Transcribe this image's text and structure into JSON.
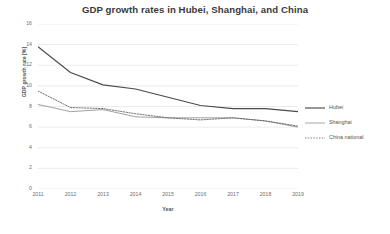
{
  "chart_data": {
    "type": "line",
    "title": "GDP growth rates in Hubei, Shanghai, and China",
    "xlabel": "Year",
    "ylabel": "GDP growth rate [%]",
    "categories": [
      "2011",
      "2012",
      "2013",
      "2014",
      "2015",
      "2016",
      "2017",
      "2018",
      "2019"
    ],
    "x": [
      2011,
      2012,
      2013,
      2014,
      2015,
      2016,
      2017,
      2018,
      2019
    ],
    "ylim": [
      0,
      16
    ],
    "yticks": [
      0,
      2,
      4,
      6,
      8,
      10,
      12,
      14,
      16
    ],
    "grid": true,
    "legend_position": "right",
    "series": [
      {
        "name": "Hubei",
        "style": "solid",
        "color": "#4a4a4a",
        "values": [
          13.8,
          11.3,
          10.1,
          9.7,
          8.9,
          8.1,
          7.8,
          7.8,
          7.5
        ]
      },
      {
        "name": "Shanghai",
        "style": "solid",
        "color": "#909090",
        "values": [
          8.2,
          7.5,
          7.7,
          7.0,
          6.9,
          6.9,
          6.9,
          6.6,
          6.0
        ]
      },
      {
        "name": "China national",
        "style": "dotted",
        "color": "#5a5a5a",
        "values": [
          9.5,
          7.9,
          7.8,
          7.3,
          6.9,
          6.7,
          6.9,
          6.6,
          6.1
        ]
      }
    ]
  },
  "legend": {
    "entries": [
      {
        "label": "Hubei"
      },
      {
        "label": "Shanghai"
      },
      {
        "label": "China national"
      }
    ]
  }
}
